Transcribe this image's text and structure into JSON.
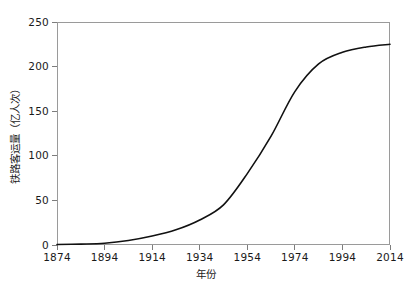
{
  "chart_data": {
    "type": "line",
    "title": "",
    "xlabel": "年份",
    "ylabel": "铁路客运量（亿人次）",
    "xlim": [
      1874,
      2014
    ],
    "ylim": [
      0,
      250
    ],
    "grid": false,
    "legend": null,
    "xticks": [
      "1874",
      "1894",
      "1914",
      "1934",
      "1954",
      "1974",
      "1994",
      "2014"
    ],
    "xtick_values": [
      1874,
      1894,
      1914,
      1934,
      1954,
      1974,
      1994,
      2014
    ],
    "yticks": [
      "0",
      "50",
      "100",
      "150",
      "200",
      "250"
    ],
    "ytick_values": [
      0,
      50,
      100,
      150,
      200,
      250
    ],
    "series": [
      {
        "name": "铁路客运量",
        "x": [
          1874,
          1884,
          1894,
          1904,
          1914,
          1924,
          1934,
          1944,
          1954,
          1964,
          1974,
          1984,
          1994,
          2004,
          2014
        ],
        "values": [
          0.5,
          1.0,
          2.0,
          5.0,
          10.0,
          17.0,
          28.0,
          45.0,
          80.0,
          122.0,
          172.0,
          203.0,
          216.0,
          222.0,
          225.0
        ]
      }
    ],
    "annotations": []
  }
}
